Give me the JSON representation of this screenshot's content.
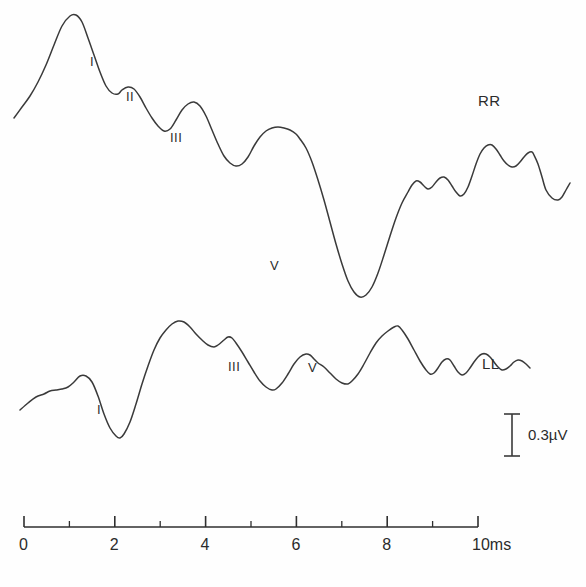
{
  "figure": {
    "title": "",
    "background_color": "#fefefe",
    "trace_color": "#3a3a3a",
    "axis_color": "#2f2f2f"
  },
  "traces": {
    "rr": {
      "name": "RR",
      "label": "RR",
      "label_x": 478,
      "label_y": 92,
      "peak_labels": [
        {
          "text": "I",
          "x": 90,
          "y": 54
        },
        {
          "text": "II",
          "x": 126,
          "y": 89
        },
        {
          "text": "III",
          "x": 170,
          "y": 130
        },
        {
          "text": "V",
          "x": 270,
          "y": 258
        }
      ]
    },
    "ll": {
      "name": "LL",
      "label": "LL",
      "label_x": 482,
      "label_y": 355,
      "peak_labels": [
        {
          "text": "I",
          "x": 97,
          "y": 402
        },
        {
          "text": "III",
          "x": 228,
          "y": 359
        },
        {
          "text": "V",
          "x": 308,
          "y": 360
        }
      ]
    }
  },
  "axis": {
    "unit": "ms",
    "label_10ms": "10ms",
    "ticks_major": [
      {
        "value": 0,
        "label": "0"
      },
      {
        "value": 2,
        "label": "2"
      },
      {
        "value": 4,
        "label": "4"
      },
      {
        "value": 6,
        "label": "6"
      },
      {
        "value": 8,
        "label": "8"
      },
      {
        "value": 10,
        "label": "10ms"
      }
    ],
    "ticks_minor": [
      1,
      3,
      5,
      7,
      9
    ],
    "x_start_px": 24,
    "x_end_px": 478,
    "y_px": 527
  },
  "scale_bar": {
    "label": "0.3µV",
    "value": 0.3,
    "unit": "µV",
    "x": 512,
    "y_top": 414,
    "y_bottom": 456,
    "label_x": 528,
    "label_y": 426
  },
  "chart_data": {
    "type": "line",
    "title": "",
    "xlabel": "10ms",
    "ylabel": "0.3µV",
    "xlim": [
      0,
      10
    ],
    "grid": false,
    "legend": "inline-right",
    "series": [
      {
        "name": "RR",
        "peaks": [
          {
            "label": "I",
            "time_ms": 1.55
          },
          {
            "label": "II",
            "time_ms": 2.35
          },
          {
            "label": "III",
            "time_ms": 3.35
          },
          {
            "label": "V",
            "time_ms": 5.45
          }
        ],
        "points": [
          [
            14,
            118
          ],
          [
            22,
            107
          ],
          [
            30,
            96
          ],
          [
            38,
            82
          ],
          [
            46,
            65
          ],
          [
            54,
            45
          ],
          [
            62,
            26
          ],
          [
            70,
            16
          ],
          [
            76,
            15
          ],
          [
            82,
            22
          ],
          [
            88,
            38
          ],
          [
            94,
            55
          ],
          [
            100,
            72
          ],
          [
            106,
            86
          ],
          [
            112,
            93
          ],
          [
            118,
            94
          ],
          [
            122,
            90
          ],
          [
            128,
            87
          ],
          [
            134,
            89
          ],
          [
            140,
            97
          ],
          [
            146,
            108
          ],
          [
            152,
            118
          ],
          [
            158,
            126
          ],
          [
            164,
            131
          ],
          [
            170,
            129
          ],
          [
            176,
            120
          ],
          [
            182,
            110
          ],
          [
            188,
            104
          ],
          [
            194,
            102
          ],
          [
            200,
            106
          ],
          [
            206,
            116
          ],
          [
            212,
            130
          ],
          [
            218,
            144
          ],
          [
            224,
            156
          ],
          [
            230,
            163
          ],
          [
            236,
            166
          ],
          [
            242,
            164
          ],
          [
            248,
            157
          ],
          [
            254,
            146
          ],
          [
            260,
            137
          ],
          [
            266,
            131
          ],
          [
            272,
            128
          ],
          [
            278,
            127
          ],
          [
            284,
            128
          ],
          [
            290,
            130
          ],
          [
            296,
            134
          ],
          [
            300,
            139
          ],
          [
            306,
            148
          ],
          [
            312,
            162
          ],
          [
            318,
            180
          ],
          [
            324,
            200
          ],
          [
            330,
            222
          ],
          [
            336,
            244
          ],
          [
            342,
            264
          ],
          [
            348,
            281
          ],
          [
            354,
            292
          ],
          [
            360,
            297
          ],
          [
            366,
            295
          ],
          [
            372,
            287
          ],
          [
            378,
            273
          ],
          [
            384,
            255
          ],
          [
            390,
            236
          ],
          [
            396,
            218
          ],
          [
            402,
            203
          ],
          [
            408,
            192
          ],
          [
            412,
            185
          ],
          [
            416,
            181
          ],
          [
            420,
            182
          ],
          [
            424,
            186
          ],
          [
            428,
            189
          ],
          [
            432,
            187
          ],
          [
            436,
            182
          ],
          [
            440,
            178
          ],
          [
            444,
            177
          ],
          [
            448,
            180
          ],
          [
            452,
            186
          ],
          [
            456,
            192
          ],
          [
            460,
            196
          ],
          [
            464,
            194
          ],
          [
            468,
            187
          ],
          [
            472,
            176
          ],
          [
            476,
            164
          ],
          [
            480,
            154
          ],
          [
            484,
            148
          ],
          [
            488,
            145
          ],
          [
            492,
            145
          ],
          [
            496,
            149
          ],
          [
            500,
            155
          ],
          [
            504,
            161
          ],
          [
            508,
            165
          ],
          [
            512,
            167
          ],
          [
            516,
            166
          ],
          [
            520,
            162
          ],
          [
            524,
            157
          ],
          [
            528,
            153
          ],
          [
            532,
            152
          ],
          [
            534,
            155
          ],
          [
            538,
            164
          ],
          [
            542,
            177
          ],
          [
            546,
            190
          ],
          [
            552,
            198
          ],
          [
            558,
            200
          ],
          [
            562,
            197
          ],
          [
            566,
            190
          ],
          [
            570,
            183
          ]
        ]
      },
      {
        "name": "LL",
        "peaks": [
          {
            "label": "I",
            "time_ms": 1.7
          },
          {
            "label": "III",
            "time_ms": 4.6
          },
          {
            "label": "V",
            "time_ms": 6.3
          }
        ],
        "points": [
          [
            20,
            410
          ],
          [
            28,
            403
          ],
          [
            36,
            397
          ],
          [
            44,
            394
          ],
          [
            50,
            391
          ],
          [
            56,
            390
          ],
          [
            62,
            389
          ],
          [
            68,
            387
          ],
          [
            74,
            382
          ],
          [
            80,
            376
          ],
          [
            86,
            376
          ],
          [
            92,
            382
          ],
          [
            98,
            396
          ],
          [
            104,
            414
          ],
          [
            110,
            428
          ],
          [
            116,
            436
          ],
          [
            120,
            438
          ],
          [
            124,
            434
          ],
          [
            130,
            422
          ],
          [
            136,
            404
          ],
          [
            142,
            384
          ],
          [
            148,
            366
          ],
          [
            154,
            350
          ],
          [
            160,
            338
          ],
          [
            166,
            330
          ],
          [
            172,
            324
          ],
          [
            178,
            321
          ],
          [
            184,
            322
          ],
          [
            190,
            327
          ],
          [
            196,
            334
          ],
          [
            202,
            340
          ],
          [
            208,
            345
          ],
          [
            214,
            347
          ],
          [
            218,
            345
          ],
          [
            224,
            340
          ],
          [
            228,
            337
          ],
          [
            232,
            338
          ],
          [
            236,
            343
          ],
          [
            242,
            352
          ],
          [
            248,
            362
          ],
          [
            254,
            372
          ],
          [
            260,
            381
          ],
          [
            266,
            387
          ],
          [
            272,
            390
          ],
          [
            276,
            389
          ],
          [
            282,
            383
          ],
          [
            288,
            374
          ],
          [
            294,
            364
          ],
          [
            300,
            357
          ],
          [
            306,
            354
          ],
          [
            310,
            355
          ],
          [
            314,
            359
          ],
          [
            318,
            363
          ],
          [
            324,
            367
          ],
          [
            330,
            373
          ],
          [
            336,
            379
          ],
          [
            342,
            383
          ],
          [
            348,
            384
          ],
          [
            352,
            381
          ],
          [
            358,
            374
          ],
          [
            364,
            364
          ],
          [
            370,
            353
          ],
          [
            376,
            343
          ],
          [
            382,
            336
          ],
          [
            388,
            331
          ],
          [
            394,
            327
          ],
          [
            398,
            326
          ],
          [
            402,
            330
          ],
          [
            408,
            339
          ],
          [
            414,
            350
          ],
          [
            420,
            361
          ],
          [
            426,
            370
          ],
          [
            430,
            374
          ],
          [
            434,
            373
          ],
          [
            438,
            368
          ],
          [
            442,
            362
          ],
          [
            446,
            359
          ],
          [
            450,
            360
          ],
          [
            454,
            366
          ],
          [
            458,
            372
          ],
          [
            462,
            375
          ],
          [
            466,
            373
          ],
          [
            470,
            368
          ],
          [
            474,
            362
          ],
          [
            478,
            357
          ],
          [
            482,
            354
          ],
          [
            486,
            354
          ],
          [
            490,
            357
          ],
          [
            494,
            362
          ],
          [
            498,
            367
          ],
          [
            502,
            370
          ],
          [
            506,
            369
          ],
          [
            510,
            366
          ],
          [
            514,
            362
          ],
          [
            518,
            360
          ],
          [
            522,
            361
          ],
          [
            526,
            364
          ],
          [
            530,
            368
          ]
        ]
      }
    ]
  }
}
